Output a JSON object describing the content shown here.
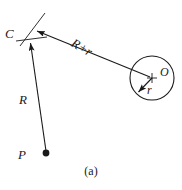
{
  "figure": {
    "caption": "(a)",
    "type": "geometry-diagram",
    "background_color": "#ffffff",
    "stroke_color": "#1a1a1a",
    "labels": {
      "point_c": "C",
      "point_p": "P",
      "point_o": "O",
      "segment_r": "R",
      "segment_r_plus_r": "R+r",
      "radius_r": "r"
    },
    "geometry": {
      "point_p": {
        "x": 46,
        "y": 153
      },
      "point_c": {
        "x": 27,
        "y": 38
      },
      "circle_center_o": {
        "x": 152,
        "y": 78
      },
      "circle_radius": 22,
      "segment_R": {
        "from": "P",
        "to": "C",
        "arrow_at": "C"
      },
      "segment_R_plus_r": {
        "from": "C",
        "to": "O",
        "arrow_at": "C"
      },
      "radius_arrow_r": {
        "from": "O",
        "to": "circle-edge-lower-left",
        "arrow_at": "edge"
      },
      "tick_marks_at_c": 2
    }
  }
}
